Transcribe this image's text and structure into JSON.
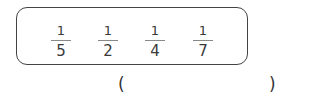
{
  "fractions": [
    {
      "numerator": "1",
      "denominator": "5"
    },
    {
      "numerator": "1",
      "denominator": "2"
    },
    {
      "numerator": "1",
      "denominator": "4"
    },
    {
      "numerator": "1",
      "denominator": "7"
    }
  ],
  "answer": {
    "open": "(",
    "close": ")",
    "value": ""
  }
}
